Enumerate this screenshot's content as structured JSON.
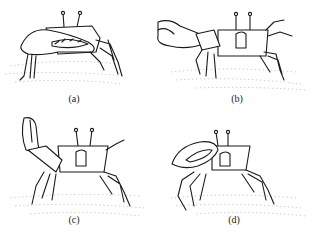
{
  "figure": {
    "panels": [
      {
        "id": "a",
        "label": "(a)",
        "posture": "claw-lowered-resting"
      },
      {
        "id": "b",
        "label": "(b)",
        "posture": "claw-extended-sideways"
      },
      {
        "id": "c",
        "label": "(c)",
        "posture": "claw-raised-vertical"
      },
      {
        "id": "d",
        "label": "(d)",
        "posture": "claw-folded-front"
      }
    ],
    "colors": {
      "ink": "#1a1a1a",
      "background": "#ffffff",
      "sand": "#9a9a9a"
    }
  }
}
